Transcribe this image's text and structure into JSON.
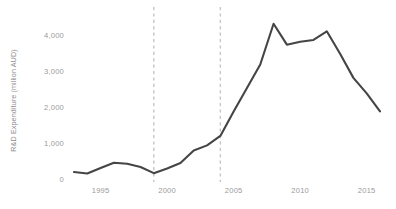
{
  "chart_data": {
    "type": "line",
    "title": "",
    "xlabel": "",
    "ylabel": "R&D Expenditure (million AUD)",
    "xlim": [
      1992.4,
      2016.6
    ],
    "ylim": [
      0,
      4600
    ],
    "grid": false,
    "legend": null,
    "x": [
      1993,
      1994,
      1995,
      1996,
      1997,
      1998,
      1999,
      2000,
      2001,
      2002,
      2003,
      2004,
      2005,
      2006,
      2007,
      2008,
      2009,
      2010,
      2011,
      2012,
      2013,
      2014,
      2015,
      2016
    ],
    "series": [
      {
        "name": "R&D Expenditure",
        "color": "#454545",
        "values": [
          220,
          180,
          330,
          480,
          450,
          360,
          190,
          320,
          470,
          820,
          960,
          1220,
          1900,
          2550,
          3200,
          4330,
          3750,
          3830,
          3880,
          4120,
          3500,
          2830,
          2400,
          1900
        ]
      }
    ],
    "yticks": [
      0,
      1000,
      2000,
      3000,
      4000
    ],
    "ytick_labels": [
      "0",
      "1,000",
      "2,000",
      "3,000",
      "4,000"
    ],
    "xticks": [
      1995,
      2000,
      2005,
      2010,
      2015
    ],
    "xtick_labels": [
      "1995",
      "2000",
      "2005",
      "2010",
      "2015"
    ],
    "annotations": [
      {
        "type": "vline",
        "name": "reference-line-1999",
        "x": 1999,
        "style": "dashed",
        "color": "#c6c6c6"
      },
      {
        "type": "vline",
        "name": "reference-line-2004",
        "x": 2004,
        "style": "dashed",
        "color": "#c6c6c6"
      }
    ]
  }
}
